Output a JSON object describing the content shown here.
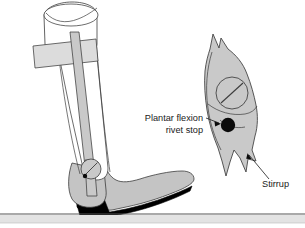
{
  "figure": {
    "background_color": "#ffffff",
    "width": 305,
    "height": 228,
    "labels": [
      {
        "id": "plantar-flexion-rivet-stop",
        "line1": "Plantar flexion",
        "line2": "rivet stop",
        "x": 203,
        "y": 121,
        "anchor": "end"
      },
      {
        "id": "stirrup",
        "line1": "Stirrup",
        "x": 262,
        "y": 187,
        "anchor": "start"
      }
    ],
    "colors": {
      "metal_gray": "#c9c9c9",
      "light_gray": "#dcdcdc",
      "shoe_gray": "#c4c4c4",
      "sole_black": "#000000",
      "outline": "#3c3c3c",
      "text": "#1a1a1a",
      "ground_line": "#555555",
      "ground_band": "#e3e3e3",
      "rivet_black": "#0a0a0a"
    },
    "parts": {
      "thigh_cuff": "thigh-cuff",
      "calf_band": "calf-band",
      "upright_bar": "upright-bar",
      "ankle_joint": "ankle-joint",
      "shoe": "shoe",
      "sole": "sole",
      "ground": "ground-line",
      "stirrup_detail": "stirrup-detail",
      "screw": "screw-head",
      "rivet": "rivet-stop"
    }
  }
}
